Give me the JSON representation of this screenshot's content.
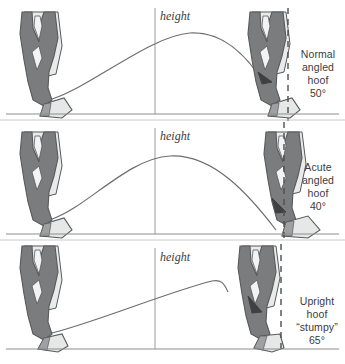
{
  "figure": {
    "background_color": "#ffffff",
    "width": 345,
    "height": 364
  },
  "colors": {
    "bone_fill": "#7b7c7e",
    "hoof_fill": "#e6e7e7",
    "pastern_light": "#e9eaea",
    "outline": "#58595b",
    "ground_line": "#8d8e90",
    "arc_line": "#6d6e70",
    "height_line": "#9a9b9d",
    "dashed_line": "#4d4e50",
    "text": "#3b3b3b"
  },
  "panels": [
    {
      "id": "panel-normal",
      "height_label": "height",
      "caption_lines": [
        "Normal",
        "angled",
        "hoof",
        "50°"
      ],
      "angle": "50°",
      "arc_type": "high-rounded-arc",
      "hoof_description": "Normal angled hoof at fifty degrees"
    },
    {
      "id": "panel-acute",
      "height_label": "height",
      "caption_lines": [
        "Acute",
        "angled",
        "hoof",
        "40°"
      ],
      "angle": "40°",
      "arc_type": "long-low-arc",
      "hoof_description": "Acute angled hoof at forty degrees"
    },
    {
      "id": "panel-upright",
      "height_label": "height",
      "caption_lines": [
        "Upright",
        "hoof",
        "“stumpy”",
        "65°"
      ],
      "angle": "65°",
      "arc_type": "steep-late-peak-arc",
      "hoof_description": "Upright stumpy hoof at sixty-five degrees"
    }
  ]
}
